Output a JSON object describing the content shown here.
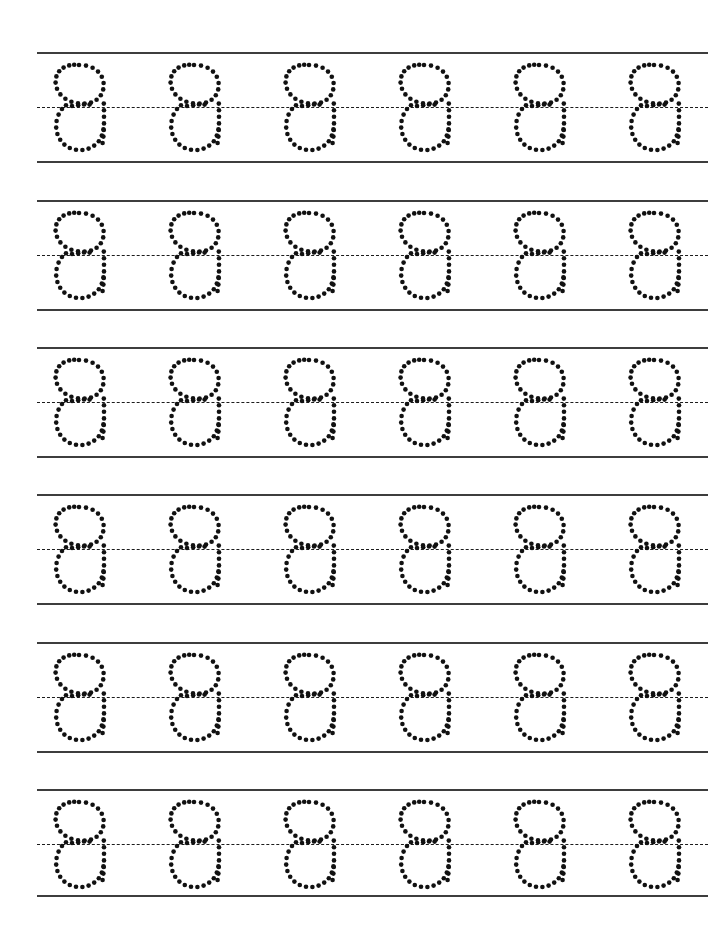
{
  "worksheet": {
    "type": "handwriting-tracing-worksheet",
    "page_title": "",
    "header_text": "",
    "footer_text": "",
    "instructions": "",
    "background_color": "#ffffff",
    "ink_color": "#111111",
    "rule_line_color": "#3d3d3d",
    "midline_color": "#1c1c1c",
    "traced_character": "a",
    "character_style": "lowercase-single-story-print",
    "stroke_style": "dotted-trace",
    "rows_count": 6,
    "letters_per_row": 6,
    "total_letters": 36,
    "page_width": 721,
    "page_height": 941
  },
  "geometry": {
    "rule_left_x": 37,
    "rule_right_x": 708,
    "rule_width": 671,
    "row_pitch": 148,
    "row_top_offsets": [
      52,
      200,
      347,
      494,
      642,
      789
    ],
    "band_top_to_mid": 55,
    "band_mid_to_base": 54,
    "band_height": 109,
    "glyph_first_x": 50,
    "glyph_pitch": 115,
    "glyph_width": 58,
    "glyph_height": 98,
    "glyph_top_offset": 11,
    "dot_radius": 2.3,
    "dash_pattern": "5 4"
  },
  "rows": [
    {
      "row_index": 1,
      "row_label": "row-1",
      "top_line_y": 52,
      "mid_line_y": 107,
      "base_line_y": 161,
      "letters": [
        "a",
        "a",
        "a",
        "a",
        "a",
        "a"
      ]
    },
    {
      "row_index": 2,
      "row_label": "row-2",
      "top_line_y": 200,
      "mid_line_y": 255,
      "base_line_y": 309,
      "letters": [
        "a",
        "a",
        "a",
        "a",
        "a",
        "a"
      ]
    },
    {
      "row_index": 3,
      "row_label": "row-3",
      "top_line_y": 347,
      "mid_line_y": 402,
      "base_line_y": 456,
      "letters": [
        "a",
        "a",
        "a",
        "a",
        "a",
        "a"
      ]
    },
    {
      "row_index": 4,
      "row_label": "row-4",
      "top_line_y": 494,
      "mid_line_y": 549,
      "base_line_y": 603,
      "letters": [
        "a",
        "a",
        "a",
        "a",
        "a",
        "a"
      ]
    },
    {
      "row_index": 5,
      "row_label": "row-5",
      "top_line_y": 642,
      "mid_line_y": 697,
      "base_line_y": 751,
      "letters": [
        "a",
        "a",
        "a",
        "a",
        "a",
        "a"
      ]
    },
    {
      "row_index": 6,
      "row_label": "row-6",
      "top_line_y": 789,
      "mid_line_y": 844,
      "base_line_y": 895,
      "letters": [
        "a",
        "a",
        "a",
        "a",
        "a",
        "a"
      ]
    }
  ],
  "glyph_dots": {
    "description": "Dot centres for one traced lowercase a, in a 58x98 local box. Bowl is an oval; a short vertical stem runs down the right side from the midline to the baseline; a small horizontal entry stroke sits on the midline.",
    "bowl": [
      [
        29.0,
        2.0
      ],
      [
        36.0,
        2.6
      ],
      [
        42.6,
        4.8
      ],
      [
        48.0,
        8.6
      ],
      [
        51.8,
        13.8
      ],
      [
        53.6,
        20.0
      ],
      [
        53.2,
        26.4
      ],
      [
        50.8,
        32.2
      ],
      [
        46.6,
        36.8
      ],
      [
        41.0,
        39.6
      ],
      [
        34.6,
        40.6
      ],
      [
        28.0,
        40.4
      ],
      [
        21.4,
        38.8
      ],
      [
        15.4,
        35.8
      ],
      [
        10.4,
        31.4
      ],
      [
        7.0,
        25.8
      ],
      [
        5.6,
        19.6
      ],
      [
        6.4,
        13.4
      ],
      [
        9.2,
        8.2
      ],
      [
        13.6,
        4.6
      ],
      [
        19.2,
        2.4
      ],
      [
        24.2,
        1.8
      ]
    ],
    "midline_entry": [
      [
        16.0,
        42.2
      ],
      [
        22.0,
        43.0
      ],
      [
        28.2,
        42.2
      ],
      [
        34.0,
        41.4
      ],
      [
        39.6,
        41.6
      ]
    ],
    "lower_bowl": [
      [
        12.0,
        46.0
      ],
      [
        8.6,
        51.6
      ],
      [
        6.6,
        58.0
      ],
      [
        6.2,
        64.6
      ],
      [
        7.4,
        71.0
      ],
      [
        10.2,
        76.8
      ],
      [
        14.4,
        81.6
      ],
      [
        19.8,
        85.0
      ],
      [
        26.0,
        86.8
      ],
      [
        32.4,
        87.0
      ],
      [
        38.6,
        85.6
      ],
      [
        44.2,
        82.6
      ],
      [
        48.8,
        78.2
      ],
      [
        51.8,
        72.6
      ],
      [
        53.4,
        66.4
      ]
    ],
    "stem": [
      [
        53.8,
        40.6
      ],
      [
        54.0,
        47.2
      ],
      [
        54.0,
        53.8
      ],
      [
        54.0,
        60.4
      ],
      [
        53.8,
        67.0
      ],
      [
        53.4,
        73.6
      ],
      [
        52.6,
        80.0
      ]
    ]
  }
}
